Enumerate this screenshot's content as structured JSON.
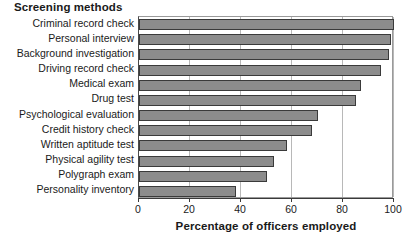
{
  "chart_data": {
    "type": "bar",
    "orientation": "horizontal",
    "title": "Screening methods",
    "xlabel": "Percentage of officers employed",
    "ylabel": "",
    "xlim": [
      0,
      100
    ],
    "xticks": [
      0,
      20,
      40,
      60,
      80,
      100
    ],
    "grid": true,
    "grid_axis": "x",
    "legend": false,
    "bar_color": "#8c8c8c",
    "bar_edge_color": "#3a3a3a",
    "categories": [
      "Criminal record check",
      "Personal interview",
      "Background investigation",
      "Driving record check",
      "Medical exam",
      "Drug test",
      "Psychological evaluation",
      "Credit history check",
      "Written aptitude test",
      "Physical agility test",
      "Polygraph exam",
      "Personality inventory"
    ],
    "values": [
      100,
      99,
      98,
      95,
      87,
      85,
      70,
      68,
      58,
      53,
      50,
      38
    ]
  }
}
